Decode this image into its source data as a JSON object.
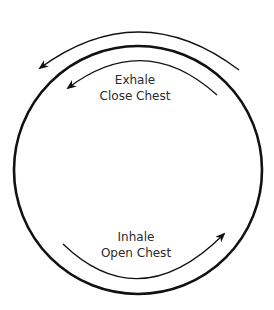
{
  "diagram": {
    "type": "breathing-cycle",
    "colors": {
      "stroke": "#111111",
      "text": "#2a2a2a",
      "background": "#ffffff"
    },
    "circle": {
      "cx": 138,
      "cy": 170,
      "r": 124
    },
    "top_label": {
      "line1": "Exhale",
      "line2": "Close Chest"
    },
    "bottom_label": {
      "line1": "Inhale",
      "line2": "Open Chest"
    },
    "arrows": [
      {
        "name": "outer-exhale-arrow",
        "direction": "counter-clockwise"
      },
      {
        "name": "inner-exhale-arrow",
        "direction": "counter-clockwise"
      },
      {
        "name": "inhale-arrow",
        "direction": "counter-clockwise-bottom-left-to-right"
      }
    ]
  }
}
